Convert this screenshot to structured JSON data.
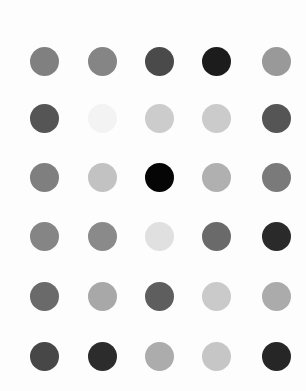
{
  "grid": {
    "rows": 6,
    "cols": 5,
    "dot_diameter": 29,
    "col_centers": [
      44,
      102,
      159,
      216,
      276
    ],
    "row_centers": [
      61,
      118,
      177,
      236,
      296,
      356
    ],
    "background": "#fdfdfd",
    "colors": [
      [
        "#808080",
        "#858585",
        "#4a4a4a",
        "#1c1c1c",
        "#999999"
      ],
      [
        "#555555",
        "#f3f3f3",
        "#cccccc",
        "#cbcbcb",
        "#555555"
      ],
      [
        "#7f7f7f",
        "#c2c2c2",
        "#050505",
        "#b0b0b0",
        "#7a7a7a"
      ],
      [
        "#858585",
        "#8a8a8a",
        "#e0e0e0",
        "#6a6a6a",
        "#2a2a2a"
      ],
      [
        "#6a6a6a",
        "#a8a8a8",
        "#5e5e5e",
        "#cacaca",
        "#ababab"
      ],
      [
        "#474747",
        "#2c2c2c",
        "#acacac",
        "#c6c6c6",
        "#262626"
      ]
    ]
  }
}
